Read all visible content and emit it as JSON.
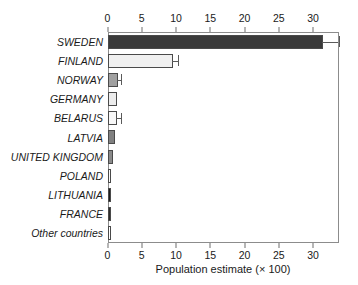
{
  "chart_data": {
    "type": "bar",
    "orientation": "horizontal",
    "title": "",
    "xlabel": "Population estimate (× 100)",
    "ylabel": "",
    "xlim": [
      0,
      33.7
    ],
    "xticks": [
      0,
      5,
      10,
      15,
      20,
      25,
      30
    ],
    "xtick_labels": [
      "0",
      "5",
      "10",
      "15",
      "20",
      "25",
      "30"
    ],
    "grid": false,
    "legend": null,
    "axis_positions": [
      "top",
      "bottom"
    ],
    "categories": [
      "SWEDEN",
      "FINLAND",
      "NORWAY",
      "GERMANY",
      "BELARUS",
      "LATVIA",
      "UNITED KINGDOM",
      "POLAND",
      "LITHUANIA",
      "FRANCE",
      "Other countries"
    ],
    "values": [
      31.5,
      9.5,
      1.55,
      1.4,
      1.4,
      1.05,
      0.75,
      0.4,
      0.3,
      0.3,
      0.45
    ],
    "error_high": [
      33.7,
      10.3,
      2.0,
      null,
      2.0,
      null,
      null,
      null,
      null,
      null,
      null
    ],
    "bar_colors": [
      "#3a3a3a",
      "#f0f0f0",
      "#a0a0a0",
      "#ececec",
      "#f7f7f7",
      "#808080",
      "#8a8a8a",
      "#fbfbfb",
      "#1c1c1c",
      "#2b2b2b",
      "#ffffff"
    ],
    "bar_edge_color": "#4a4a4a",
    "error_bar_color": "#5a5a5a",
    "axis_color": "#8c8c8c",
    "text_color": "#1a1a1a",
    "background": "#ffffff"
  }
}
